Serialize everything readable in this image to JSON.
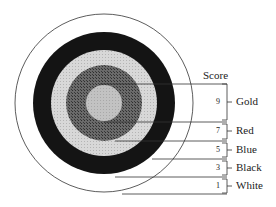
{
  "diagram": {
    "title_label": "Score",
    "rings": [
      {
        "name": "Gold",
        "score": "9",
        "fill": "#bdbdbd"
      },
      {
        "name": "Red",
        "score": "7",
        "fill": "#5a5a5a"
      },
      {
        "name": "Blue",
        "score": "5",
        "fill": "#d4d4d4"
      },
      {
        "name": "Black",
        "score": "3",
        "fill": "#161616"
      },
      {
        "name": "White",
        "score": "1",
        "fill": "#ffffff"
      }
    ]
  }
}
